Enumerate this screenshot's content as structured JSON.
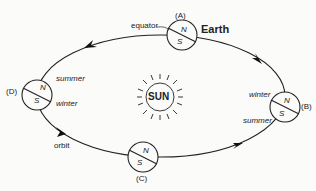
{
  "sun": {
    "label": "SUN"
  },
  "earth_label": "Earth",
  "orbit_label": "orbit",
  "equator_label": "equator",
  "positions": [
    {
      "id": "A",
      "label": "(A)",
      "north": "N",
      "south": "S"
    },
    {
      "id": "B",
      "label": "(B)",
      "north": "N",
      "south": "S",
      "north_season": "winter",
      "south_season": "summer"
    },
    {
      "id": "C",
      "label": "(C)",
      "north": "N",
      "south": "S"
    },
    {
      "id": "D",
      "label": "(D)",
      "north": "N",
      "south": "S",
      "north_season": "summer",
      "south_season": "winter"
    }
  ],
  "colors": {
    "line": "#222222",
    "background": "#fbfbfa"
  }
}
